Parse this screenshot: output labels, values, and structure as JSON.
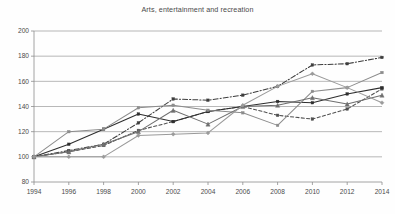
{
  "chart_data": {
    "type": "line",
    "title": "Arts, entertainment and recreation",
    "xlabel": "",
    "ylabel": "",
    "x": [
      1994,
      1996,
      1998,
      2000,
      2002,
      2004,
      2006,
      2008,
      2010,
      2012,
      2014
    ],
    "xtick_labels": [
      "1994",
      "1996",
      "1998",
      "2000",
      "2002",
      "2004",
      "2006",
      "2008",
      "2010",
      "2012",
      "2014"
    ],
    "ytick_labels": [
      "80",
      "100",
      "120",
      "140",
      "160",
      "180",
      "200"
    ],
    "yticks": [
      80,
      100,
      120,
      140,
      160,
      180,
      200
    ],
    "ylim": [
      80,
      200
    ],
    "xlim": [
      1994,
      2014
    ],
    "grid": "horizontal",
    "legend": "none",
    "index_base": 100,
    "series": [
      {
        "name": "series-1",
        "style": "dash-dot",
        "marker": "square",
        "color": "#3d3d3d",
        "values": [
          100,
          105,
          110,
          127,
          146,
          145,
          149,
          156,
          173,
          174,
          179
        ]
      },
      {
        "name": "series-2",
        "style": "dashed",
        "marker": "square",
        "color": "#4f4f4f",
        "values": [
          100,
          104,
          109,
          121,
          128,
          136,
          140,
          133,
          130,
          138,
          154
        ]
      },
      {
        "name": "series-3",
        "style": "solid",
        "marker": "square",
        "color": "#2e2e2e",
        "values": [
          100,
          110,
          122,
          134,
          128,
          136,
          140,
          144,
          143,
          150,
          155
        ]
      },
      {
        "name": "series-4",
        "style": "solid",
        "marker": "square",
        "color": "#8c8c8c",
        "values": [
          100,
          120,
          122,
          139,
          141,
          137,
          135,
          125,
          152,
          155,
          167
        ]
      },
      {
        "name": "series-5",
        "style": "solid",
        "marker": "triangle",
        "color": "#6f6f6f",
        "values": [
          100,
          104,
          110,
          120,
          137,
          126,
          140,
          141,
          147,
          142,
          149
        ]
      },
      {
        "name": "series-6",
        "style": "solid",
        "marker": "diamond",
        "color": "#9a9a9a",
        "values": [
          100,
          100,
          100,
          117,
          118,
          119,
          141,
          156,
          166,
          155,
          143
        ]
      }
    ]
  }
}
